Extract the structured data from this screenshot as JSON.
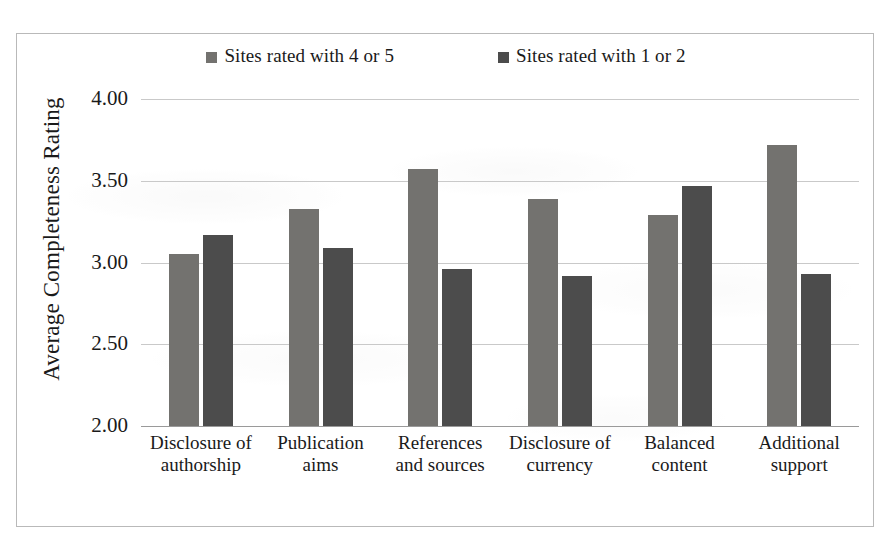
{
  "figure": {
    "frame_border_color": "#b9b9b9",
    "background_color": "#ffffff"
  },
  "legend": {
    "position": "top-center",
    "entries": [
      {
        "label": "Sites rated with 4 or 5",
        "color": "#73726f",
        "swatch_icon": "square-marker-icon"
      },
      {
        "label": "Sites rated with 1 or 2",
        "color": "#4c4c4c",
        "swatch_icon": "square-marker-icon"
      }
    ]
  },
  "axes": {
    "y_title": "Average Completeness Rating",
    "y_ticks": [
      "4.00",
      "3.50",
      "3.00",
      "2.50",
      "2.00"
    ],
    "x_title": ""
  },
  "chart_data": {
    "type": "bar",
    "title": "",
    "subtitle": "",
    "xlabel": "",
    "ylabel": "Average Completeness Rating",
    "ylim": [
      2.0,
      4.0
    ],
    "ytick_values": [
      4.0,
      3.5,
      3.0,
      2.5,
      2.0
    ],
    "grid": true,
    "legend_position": "top-center",
    "categories": [
      "Disclosure of authorship",
      "Publication aims",
      "References and sources",
      "Disclosure of currency",
      "Balanced content",
      "Additional support"
    ],
    "category_lines": [
      [
        "Disclosure of",
        "authorship"
      ],
      [
        "Publication",
        "aims"
      ],
      [
        "References",
        "and sources"
      ],
      [
        "Disclosure of",
        "currency"
      ],
      [
        "Balanced",
        "content"
      ],
      [
        "Additional",
        "support"
      ]
    ],
    "series": [
      {
        "name": "Sites rated with 4 or 5",
        "color": "#73726f",
        "values": [
          3.05,
          3.33,
          3.57,
          3.39,
          3.29,
          3.72
        ]
      },
      {
        "name": "Sites rated with 1 or 2",
        "color": "#4c4c4c",
        "values": [
          3.17,
          3.09,
          2.96,
          2.92,
          3.47,
          2.93
        ]
      }
    ]
  }
}
